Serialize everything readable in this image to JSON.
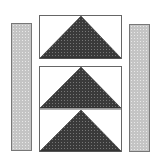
{
  "diagram": {
    "type": "quilt-block",
    "colors": {
      "background": "#ffffff",
      "side_bar_fill": "#c4c4c4",
      "triangle_fill": "#3a3a3a",
      "outline": "#666666"
    },
    "side_bars": [
      {
        "id": "left",
        "x": 11,
        "y": 23,
        "w": 21,
        "h": 128
      },
      {
        "id": "right",
        "x": 129,
        "y": 24,
        "w": 21,
        "h": 128
      }
    ],
    "units": [
      {
        "id": "top",
        "x": 39,
        "y": 15,
        "w": 83,
        "h": 44
      },
      {
        "id": "middle",
        "x": 39,
        "y": 66,
        "w": 83,
        "h": 43
      },
      {
        "id": "bottom",
        "x": 39,
        "y": 109,
        "w": 83,
        "h": 43
      }
    ]
  }
}
